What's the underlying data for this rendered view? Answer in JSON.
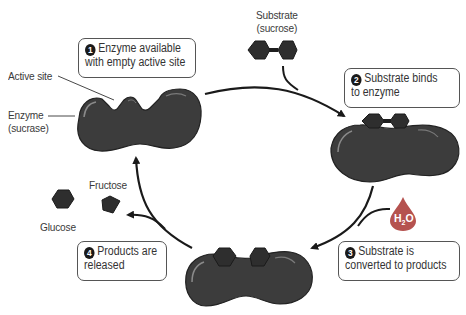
{
  "steps": [
    {
      "number": "1",
      "line1": "Enzyme available",
      "line2": "with empty active site"
    },
    {
      "number": "2",
      "line1": "Substrate binds",
      "line2": "to enzyme"
    },
    {
      "number": "3",
      "line1": "Substrate is",
      "line2": "converted to products"
    },
    {
      "number": "4",
      "line1": "Products are",
      "line2": "released"
    }
  ],
  "labels": {
    "active_site": "Active site",
    "enzyme_line1": "Enzyme",
    "enzyme_line2": "(sucrase)",
    "substrate_line1": "Substrate",
    "substrate_line2": "(sucrose)",
    "fructose": "Fructose",
    "glucose": "Glucose",
    "water": "H",
    "water_sub": "2",
    "water_o": "O"
  },
  "colors": {
    "enzyme": "#3c3c3c",
    "enzyme_highlight": "#8a8a8a",
    "molecule": "#2e2e2e",
    "water_drop": "#b5524f",
    "arrow": "#1a1a1a",
    "box_border": "#555555"
  }
}
